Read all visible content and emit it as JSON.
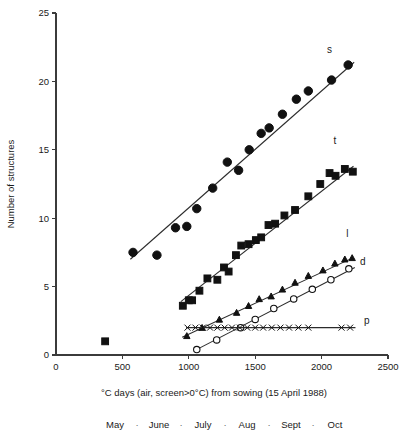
{
  "chart_data": {
    "type": "scatter",
    "title": "",
    "xlabel": "°C days (air, screen>0°C) from sowing (15 April 1988)",
    "ylabel": "Number of structures",
    "xlim": [
      0,
      2500
    ],
    "ylim": [
      0,
      25
    ],
    "xticks": [
      0,
      500,
      1000,
      1500,
      2000,
      2500
    ],
    "xticklabels": [
      "0",
      "500",
      "1000",
      "1500",
      "2000",
      "2500"
    ],
    "yticks": [
      0,
      5,
      10,
      15,
      20,
      25
    ],
    "yticklabels": [
      "0",
      "5",
      "10",
      "15",
      "20",
      "25"
    ],
    "grid": false,
    "legend_position": "inline-right-of-series",
    "secondary_axis": {
      "name": "months",
      "labels": [
        "May",
        "June",
        "July",
        "Aug",
        "Sept",
        "Oct"
      ],
      "separator": "·"
    },
    "series": [
      {
        "name": "s",
        "label": "s",
        "marker": "filled-circle",
        "marker_size": 4.2,
        "fit_line": {
          "x": [
            560,
            2245
          ],
          "y": [
            7.0,
            21.4
          ]
        },
        "points": [
          {
            "x": 580,
            "y": 7.5
          },
          {
            "x": 760,
            "y": 7.3
          },
          {
            "x": 900,
            "y": 9.3
          },
          {
            "x": 985,
            "y": 9.4
          },
          {
            "x": 1060,
            "y": 10.7
          },
          {
            "x": 1180,
            "y": 12.2
          },
          {
            "x": 1290,
            "y": 14.1
          },
          {
            "x": 1375,
            "y": 13.5
          },
          {
            "x": 1455,
            "y": 15.0
          },
          {
            "x": 1545,
            "y": 16.2
          },
          {
            "x": 1605,
            "y": 16.6
          },
          {
            "x": 1705,
            "y": 17.6
          },
          {
            "x": 1810,
            "y": 18.7
          },
          {
            "x": 1900,
            "y": 19.3
          },
          {
            "x": 2075,
            "y": 20.1
          },
          {
            "x": 2200,
            "y": 21.2
          }
        ]
      },
      {
        "name": "t",
        "label": "t",
        "marker": "filled-square",
        "marker_size": 3.4,
        "fit_line": {
          "x": [
            940,
            2240
          ],
          "y": [
            3.9,
            13.8
          ]
        },
        "points": [
          {
            "x": 370,
            "y": 1.0
          },
          {
            "x": 955,
            "y": 3.6
          },
          {
            "x": 1000,
            "y": 4.0
          },
          {
            "x": 1025,
            "y": 4.0
          },
          {
            "x": 1080,
            "y": 4.7
          },
          {
            "x": 1140,
            "y": 5.6
          },
          {
            "x": 1215,
            "y": 5.5
          },
          {
            "x": 1265,
            "y": 6.4
          },
          {
            "x": 1300,
            "y": 6.1
          },
          {
            "x": 1355,
            "y": 7.3
          },
          {
            "x": 1395,
            "y": 8.0
          },
          {
            "x": 1450,
            "y": 8.1
          },
          {
            "x": 1505,
            "y": 8.4
          },
          {
            "x": 1545,
            "y": 8.6
          },
          {
            "x": 1600,
            "y": 9.5
          },
          {
            "x": 1650,
            "y": 9.6
          },
          {
            "x": 1720,
            "y": 10.2
          },
          {
            "x": 1800,
            "y": 10.6
          },
          {
            "x": 1900,
            "y": 11.6
          },
          {
            "x": 1990,
            "y": 12.5
          },
          {
            "x": 2060,
            "y": 13.3
          },
          {
            "x": 2105,
            "y": 13.1
          },
          {
            "x": 2175,
            "y": 13.6
          },
          {
            "x": 2235,
            "y": 13.4
          }
        ]
      },
      {
        "name": "l",
        "label": "l",
        "marker": "filled-triangle",
        "marker_size": 3.2,
        "fit_line": {
          "x": [
            950,
            2235
          ],
          "y": [
            1.3,
            7.1
          ]
        },
        "points": [
          {
            "x": 985,
            "y": 1.4
          },
          {
            "x": 1100,
            "y": 2.0
          },
          {
            "x": 1230,
            "y": 2.6
          },
          {
            "x": 1360,
            "y": 3.1
          },
          {
            "x": 1450,
            "y": 3.6
          },
          {
            "x": 1530,
            "y": 4.1
          },
          {
            "x": 1620,
            "y": 4.3
          },
          {
            "x": 1705,
            "y": 4.8
          },
          {
            "x": 1800,
            "y": 5.3
          },
          {
            "x": 1900,
            "y": 5.8
          },
          {
            "x": 2010,
            "y": 6.2
          },
          {
            "x": 2100,
            "y": 6.7
          },
          {
            "x": 2175,
            "y": 7.0
          },
          {
            "x": 2230,
            "y": 7.1
          }
        ]
      },
      {
        "name": "d",
        "label": "d",
        "marker": "open-circle",
        "marker_size": 3.2,
        "fit_line": {
          "x": [
            1040,
            2250
          ],
          "y": [
            0.3,
            6.4
          ]
        },
        "points": [
          {
            "x": 1060,
            "y": 0.4
          },
          {
            "x": 1210,
            "y": 1.1
          },
          {
            "x": 1390,
            "y": 2.0
          },
          {
            "x": 1500,
            "y": 2.6
          },
          {
            "x": 1640,
            "y": 3.4
          },
          {
            "x": 1790,
            "y": 4.1
          },
          {
            "x": 1930,
            "y": 4.8
          },
          {
            "x": 2070,
            "y": 5.5
          },
          {
            "x": 2205,
            "y": 6.3
          }
        ]
      },
      {
        "name": "p",
        "label": "p",
        "marker": "cross",
        "marker_size": 3.0,
        "fit_line": {
          "x": [
            980,
            2255
          ],
          "y": [
            2.0,
            2.0
          ]
        },
        "points": [
          {
            "x": 990,
            "y": 2.0
          },
          {
            "x": 1050,
            "y": 2.0
          },
          {
            "x": 1105,
            "y": 2.0
          },
          {
            "x": 1160,
            "y": 2.0
          },
          {
            "x": 1215,
            "y": 2.0
          },
          {
            "x": 1270,
            "y": 2.0
          },
          {
            "x": 1325,
            "y": 2.0
          },
          {
            "x": 1385,
            "y": 2.0
          },
          {
            "x": 1440,
            "y": 2.0
          },
          {
            "x": 1500,
            "y": 2.0
          },
          {
            "x": 1560,
            "y": 2.0
          },
          {
            "x": 1625,
            "y": 2.0
          },
          {
            "x": 1690,
            "y": 2.0
          },
          {
            "x": 1755,
            "y": 2.0
          },
          {
            "x": 1825,
            "y": 2.0
          },
          {
            "x": 1900,
            "y": 2.0
          },
          {
            "x": 2150,
            "y": 2.0
          },
          {
            "x": 2215,
            "y": 2.0
          }
        ]
      }
    ],
    "series_labels": [
      {
        "name": "s",
        "text": "s",
        "x": 2040,
        "y": 22.1
      },
      {
        "name": "t",
        "text": "t",
        "x": 2090,
        "y": 15.4
      },
      {
        "name": "l",
        "text": "l",
        "x": 2185,
        "y": 8.6
      },
      {
        "name": "d",
        "text": "d",
        "x": 2290,
        "y": 6.6
      },
      {
        "name": "p",
        "text": "p",
        "x": 2320,
        "y": 2.3
      }
    ]
  },
  "colors": {
    "ink": "#1a1a1a",
    "axis": "#3b3b3b",
    "marker": "#111111",
    "line": "#2b2b2b",
    "background": "#ffffff"
  }
}
